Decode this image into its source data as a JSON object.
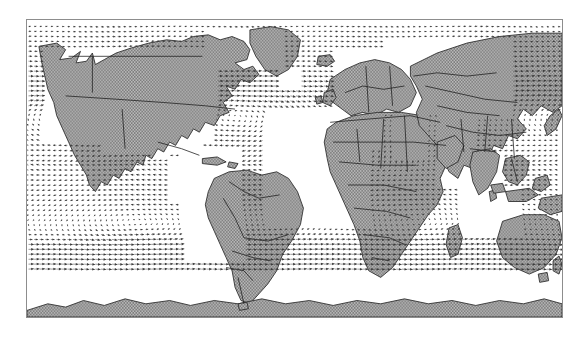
{
  "figure": {
    "kind": "world-map-vector-field",
    "projection": "equirectangular",
    "frame": {
      "x": 26,
      "y": 19,
      "width": 537,
      "height": 299,
      "border_color": "#8d8d8d"
    },
    "background_color": "#ffffff",
    "land_fill_color": "#969696",
    "land_outline_color": "#1f1f1f",
    "country_border_color": "#202020",
    "ocean_color": "#ffffff",
    "arrow_color": "#4a4a4a",
    "arrow_color_strong": "#2a2a2a",
    "title": "",
    "subtitle": "",
    "colorbar": "",
    "axis_labels": {
      "x": "",
      "y": ""
    },
    "tick_labels_x": [],
    "tick_labels_y": []
  },
  "chart_data": {
    "type": "quiver",
    "title": "",
    "xlabel": "",
    "ylabel": "",
    "xlim": [
      -180,
      180
    ],
    "ylim": [
      -90,
      90
    ],
    "grid": false,
    "legend": "none",
    "units": "arbitrary (surface wind / current vectors)",
    "grid_spacing_deg": {
      "lon": 3.75,
      "lat": 3.0
    },
    "regions": [
      {
        "name": "North Pacific gyre",
        "center_lon": -155,
        "center_lat": 32,
        "rotation": "clockwise",
        "strength": "moderate"
      },
      {
        "name": "North Atlantic gyre",
        "center_lon": -42,
        "center_lat": 32,
        "rotation": "clockwise",
        "strength": "moderate"
      },
      {
        "name": "North-east trade winds",
        "center_lon": -140,
        "center_lat": 14,
        "rotation": "easterly",
        "strength": "strong"
      },
      {
        "name": "South-east trade winds",
        "center_lon": -120,
        "center_lat": -14,
        "rotation": "easterly",
        "strength": "strong"
      },
      {
        "name": "South Pacific gyre",
        "center_lon": -110,
        "center_lat": -32,
        "rotation": "counterclockwise",
        "strength": "moderate"
      },
      {
        "name": "South Atlantic gyre",
        "center_lon": -18,
        "center_lat": -30,
        "rotation": "counterclockwise",
        "strength": "moderate"
      },
      {
        "name": "South Indian gyre",
        "center_lon": 80,
        "center_lat": -30,
        "rotation": "counterclockwise",
        "strength": "moderate"
      },
      {
        "name": "Southern Ocean westerlies",
        "center_lon": 0,
        "center_lat": -52,
        "rotation": "westerly",
        "strength": "very strong"
      },
      {
        "name": "Indian monsoon flow",
        "center_lon": 70,
        "center_lat": 8,
        "rotation": "south-westerly",
        "strength": "strong"
      },
      {
        "name": "North Atlantic westerlies",
        "center_lon": -35,
        "center_lat": 50,
        "rotation": "westerly",
        "strength": "strong"
      }
    ]
  },
  "landmasses": [
    {
      "name": "North America"
    },
    {
      "name": "Greenland"
    },
    {
      "name": "South America"
    },
    {
      "name": "Europe"
    },
    {
      "name": "Africa"
    },
    {
      "name": "Asia"
    },
    {
      "name": "Australia"
    },
    {
      "name": "New Zealand"
    },
    {
      "name": "Antarctica"
    },
    {
      "name": "Madagascar"
    },
    {
      "name": "Japan"
    },
    {
      "name": "Indonesia"
    },
    {
      "name": "Philippines"
    },
    {
      "name": "British Isles"
    },
    {
      "name": "Iceland"
    },
    {
      "name": "Sri Lanka"
    },
    {
      "name": "Cuba"
    },
    {
      "name": "Caribbean islands"
    }
  ]
}
